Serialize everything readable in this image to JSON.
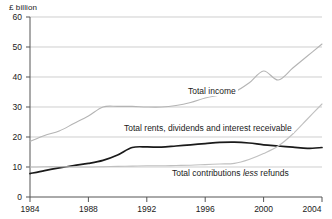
{
  "chart_data": {
    "type": "line",
    "title": "",
    "subtitle": "",
    "xlabel": "",
    "ylabel": "£ billion",
    "unit_label": "£ billion",
    "xlim": [
      1984,
      2004
    ],
    "ylim": [
      0,
      60
    ],
    "grid": true,
    "legend_position": "inline-annotations",
    "x_ticks": [
      "1984",
      "1988",
      "1992",
      "1996",
      "2000",
      "2004"
    ],
    "y_ticks": [
      "0",
      "10",
      "20",
      "30",
      "40",
      "50",
      "60"
    ],
    "x": [
      1984,
      1985,
      1986,
      1987,
      1988,
      1989,
      1990,
      1991,
      1992,
      1993,
      1994,
      1995,
      1996,
      1997,
      1998,
      1999,
      2000,
      2001,
      2002,
      2003,
      2004
    ],
    "series": [
      {
        "name": "Total income",
        "color": "#b4b4b4",
        "values": [
          18.5,
          20.5,
          22.0,
          24.5,
          27.0,
          30.0,
          30.2,
          30.2,
          30.0,
          30.0,
          30.5,
          31.5,
          33.0,
          34.0,
          35.0,
          38.0,
          42.0,
          39.0,
          43.0,
          47.0,
          51.0
        ]
      },
      {
        "name": "Total rents, dividends and interest receivable",
        "color": "#1a1a1a",
        "values": [
          7.8,
          8.8,
          9.7,
          10.5,
          11.2,
          12.2,
          14.0,
          16.5,
          16.7,
          16.6,
          17.0,
          17.4,
          17.8,
          18.2,
          18.3,
          18.0,
          17.4,
          17.0,
          16.6,
          16.2,
          16.5
        ]
      },
      {
        "name": "Total contributions less refunds",
        "color": "#c0c0c0",
        "values": [
          10.0,
          10.1,
          10.1,
          10.0,
          10.0,
          10.1,
          10.2,
          10.3,
          10.4,
          10.4,
          10.5,
          10.6,
          10.8,
          11.0,
          11.2,
          12.5,
          14.5,
          17.0,
          21.0,
          26.0,
          31.0
        ]
      }
    ],
    "annotations": [
      {
        "id": "total-income",
        "text": "Total income",
        "text_pre": "Total income",
        "text_em": "",
        "text_post": ""
      },
      {
        "id": "total-rents",
        "text": "Total rents, dividends and interest receivable",
        "text_pre": "Total rents, dividends and interest receivable",
        "text_em": "",
        "text_post": ""
      },
      {
        "id": "total-contributions",
        "text": "Total contributions less refunds",
        "text_pre": "Total contributions ",
        "text_em": "less",
        "text_post": " refunds"
      }
    ]
  }
}
